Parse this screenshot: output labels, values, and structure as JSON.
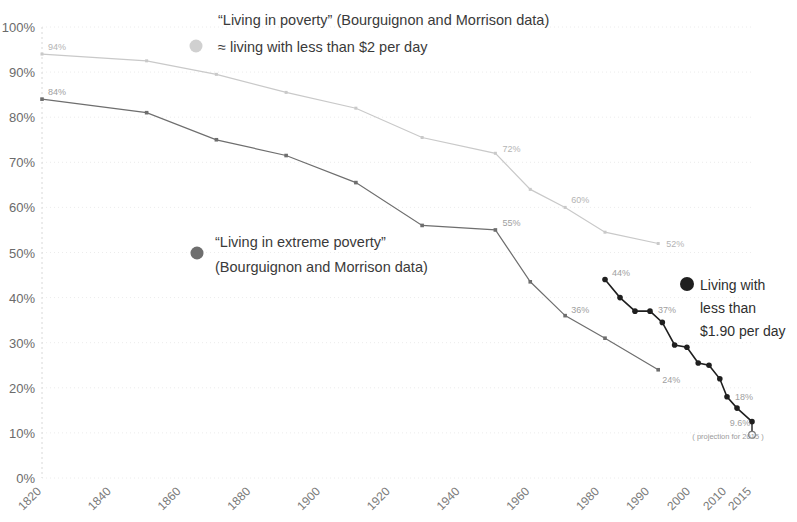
{
  "chart_data": {
    "type": "line",
    "title": "",
    "xlabel": "",
    "ylabel": "",
    "ylim": [
      0,
      100
    ],
    "xlim": [
      1820,
      2015
    ],
    "grid": true,
    "y_ticks": [
      "0%",
      "10%",
      "20%",
      "30%",
      "40%",
      "50%",
      "60%",
      "70%",
      "80%",
      "90%",
      "100%"
    ],
    "y_tick_values": [
      0,
      10,
      20,
      30,
      40,
      50,
      60,
      70,
      80,
      90,
      100
    ],
    "x_ticks": [
      "1820",
      "1840",
      "1860",
      "1880",
      "1900",
      "1920",
      "1940",
      "1960",
      "1980",
      "1990",
      "2000",
      "2010",
      "2015"
    ],
    "x_tick_values": [
      1820,
      1840,
      1860,
      1880,
      1900,
      1920,
      1940,
      1960,
      1980,
      1990,
      2000,
      2010,
      2015
    ],
    "legend_position": "in-plot",
    "series": [
      {
        "name": "“Living in poverty” (Bourguignon and Morrison data)",
        "color": "#c9c9c9",
        "marker": "small-square",
        "x": [
          1820,
          1850,
          1870,
          1890,
          1910,
          1929,
          1950,
          1960,
          1970,
          1981,
          1992
        ],
        "values": [
          94,
          92.5,
          89.5,
          85.5,
          82,
          75.5,
          72,
          64,
          60,
          54.5,
          52
        ],
        "point_labels": [
          {
            "x": 1820,
            "value": 94,
            "text": "94%"
          },
          {
            "x": 1950,
            "value": 72,
            "text": "72%"
          },
          {
            "x": 1970,
            "value": 60,
            "text": "60%"
          },
          {
            "x": 1992,
            "value": 52,
            "text": "52%"
          }
        ]
      },
      {
        "name": "“Living in extreme poverty” (Bourguignon and Morrison data)",
        "color": "#6e6e6e",
        "marker": "square",
        "x": [
          1820,
          1850,
          1870,
          1890,
          1910,
          1929,
          1950,
          1960,
          1970,
          1981,
          1992
        ],
        "values": [
          84,
          81,
          75,
          71.5,
          65.5,
          56,
          55,
          43.5,
          36,
          31,
          24
        ],
        "point_labels": [
          {
            "x": 1820,
            "value": 84,
            "text": "84%"
          },
          {
            "x": 1950,
            "value": 55,
            "text": "55%"
          },
          {
            "x": 1970,
            "value": 36,
            "text": "36%"
          },
          {
            "x": 1992,
            "value": 24,
            "text": "24%"
          }
        ]
      },
      {
        "name": "Living with less than $1.90 per day",
        "color": "#1f1f1f",
        "marker": "dot",
        "x": [
          1981,
          1984,
          1987,
          1990,
          1993,
          1996,
          1999,
          2002,
          2005,
          2008,
          2010,
          2012,
          2015
        ],
        "values": [
          44,
          40,
          37,
          37,
          34.5,
          29.5,
          29,
          25.5,
          25,
          22,
          18,
          15.5,
          12.5
        ],
        "point_labels": [
          {
            "x": 1981,
            "value": 44,
            "text": "44%"
          },
          {
            "x": 1990,
            "value": 37,
            "text": "37%"
          },
          {
            "x": 2010,
            "value": 18,
            "text": "18%"
          }
        ],
        "projection_point": {
          "x": 2015,
          "value": 9.6,
          "text": "9.6%",
          "note": "( projection for 2015 )",
          "marker": "open-circle"
        }
      }
    ],
    "annotations": [
      {
        "name": "poverty-annotation",
        "marker": "light-dot",
        "lines": [
          "“Living in poverty” (Bourguignon and Morrison data)",
          "≈ living with less than $2 per day"
        ]
      },
      {
        "name": "extreme-poverty-annotation",
        "marker": "grey-dot",
        "lines": [
          "“Living in extreme poverty”",
          "(Bourguignon and Morrison data)"
        ]
      },
      {
        "name": "dollar190-annotation",
        "marker": "dark-dot",
        "lines": [
          "Living with",
          "less than",
          "$1.90 per day"
        ]
      }
    ]
  },
  "colors": {
    "light_series": "#c9c9c9",
    "mid_series": "#6e6e6e",
    "dark_series": "#1f1f1f",
    "grid": "#e3e3e3",
    "axis_text": "#6b6b6b"
  }
}
